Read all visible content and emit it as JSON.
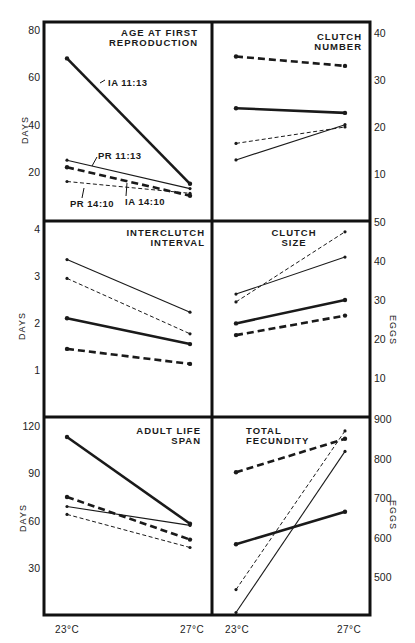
{
  "chart_data": [
    {
      "id": "age_first_reproduction",
      "type": "line",
      "title": "AGE AT FIRST REPRODUCTION",
      "title_lines": [
        "AGE AT FIRST",
        "REPRODUCTION"
      ],
      "ylabel": "DAYS",
      "yaxis_side": "left",
      "ylim": [
        0,
        80
      ],
      "yticks": [
        20,
        40,
        60,
        80
      ],
      "categories": [
        "23°C",
        "27°C"
      ],
      "grid": false,
      "series": [
        {
          "name": "IA 11:13",
          "style": "thick-solid",
          "values": [
            68,
            15
          ]
        },
        {
          "name": "IA 14:10",
          "style": "thick-dashed",
          "values": [
            22,
            10
          ]
        },
        {
          "name": "PR 11:13",
          "style": "thin-solid",
          "values": [
            25,
            13
          ]
        },
        {
          "name": "PR 14:10",
          "style": "thin-dashed",
          "values": [
            16,
            11
          ]
        }
      ],
      "annotations": [
        "IA 11:13",
        "PR 11:13",
        "PR 14:10",
        "IA 14:10"
      ]
    },
    {
      "id": "clutch_number",
      "type": "line",
      "title": "CLUTCH NUMBER",
      "title_lines": [
        "CLUTCH",
        "NUMBER"
      ],
      "ylabel": "",
      "yaxis_side": "right",
      "ylim": [
        0,
        42
      ],
      "yticks": [
        10,
        20,
        30,
        40
      ],
      "categories": [
        "23°C",
        "27°C"
      ],
      "grid": false,
      "series": [
        {
          "name": "IA 11:13",
          "style": "thick-solid",
          "values": [
            24,
            23
          ]
        },
        {
          "name": "IA 14:10",
          "style": "thick-dashed",
          "values": [
            35,
            33
          ]
        },
        {
          "name": "PR 11:13",
          "style": "thin-solid",
          "values": [
            13,
            20.5
          ]
        },
        {
          "name": "PR 14:10",
          "style": "thin-dashed",
          "values": [
            16.5,
            20
          ]
        }
      ]
    },
    {
      "id": "interclutch_interval",
      "type": "line",
      "title": "INTERCLUTCH INTERVAL",
      "title_lines": [
        "INTERCLUTCH",
        "INTERVAL"
      ],
      "ylabel": "DAYS",
      "yaxis_side": "left",
      "ylim": [
        0,
        4
      ],
      "yticks": [
        1,
        2,
        3,
        4
      ],
      "categories": [
        "23°C",
        "27°C"
      ],
      "grid": false,
      "series": [
        {
          "name": "IA 11:13",
          "style": "thick-solid",
          "values": [
            2.1,
            1.55
          ]
        },
        {
          "name": "IA 14:10",
          "style": "thick-dashed",
          "values": [
            1.45,
            1.13
          ]
        },
        {
          "name": "PR 11:13",
          "style": "thin-solid",
          "values": [
            3.35,
            2.23
          ]
        },
        {
          "name": "PR 14:10",
          "style": "thin-dashed",
          "values": [
            2.95,
            1.77
          ]
        }
      ]
    },
    {
      "id": "clutch_size",
      "type": "line",
      "title": "CLUTCH SIZE",
      "title_lines": [
        "CLUTCH",
        "SIZE"
      ],
      "ylabel": "EGGS",
      "yaxis_side": "right",
      "ylim": [
        0,
        50
      ],
      "yticks": [
        10,
        20,
        30,
        40,
        50
      ],
      "categories": [
        "23°C",
        "27°C"
      ],
      "grid": false,
      "series": [
        {
          "name": "IA 11:13",
          "style": "thick-solid",
          "values": [
            24,
            30
          ]
        },
        {
          "name": "IA 14:10",
          "style": "thick-dashed",
          "values": [
            21,
            26
          ]
        },
        {
          "name": "PR 11:13",
          "style": "thin-solid",
          "values": [
            31.5,
            41
          ]
        },
        {
          "name": "PR 14:10",
          "style": "thin-dashed",
          "values": [
            29.5,
            47.5
          ]
        }
      ]
    },
    {
      "id": "adult_life_span",
      "type": "line",
      "title": "ADULT LIFE SPAN",
      "title_lines": [
        "ADULT LIFE",
        "SPAN"
      ],
      "ylabel": "DAYS",
      "yaxis_side": "left",
      "ylim": [
        0,
        123
      ],
      "yticks": [
        30,
        60,
        90,
        120
      ],
      "categories": [
        "23°C",
        "27°C"
      ],
      "grid": false,
      "series": [
        {
          "name": "IA 11:13",
          "style": "thick-solid",
          "values": [
            113,
            58
          ]
        },
        {
          "name": "IA 14:10",
          "style": "thick-dashed",
          "values": [
            75,
            48
          ]
        },
        {
          "name": "PR 11:13",
          "style": "thin-solid",
          "values": [
            69,
            57
          ]
        },
        {
          "name": "PR 14:10",
          "style": "thin-dashed",
          "values": [
            64,
            43
          ]
        }
      ]
    },
    {
      "id": "total_fecundity",
      "type": "line",
      "title": "TOTAL FECUNDITY",
      "title_lines": [
        "TOTAL",
        "FECUNDITY"
      ],
      "ylabel": "EGGS",
      "yaxis_side": "right",
      "ylim": [
        410,
        900
      ],
      "yticks": [
        500,
        600,
        700,
        800,
        900
      ],
      "categories": [
        "23°C",
        "27°C"
      ],
      "grid": false,
      "series": [
        {
          "name": "IA 11:13",
          "style": "thick-solid",
          "values": [
            583,
            665
          ]
        },
        {
          "name": "IA 14:10",
          "style": "thick-dashed",
          "values": [
            765,
            850
          ]
        },
        {
          "name": "PR 11:13",
          "style": "thin-solid",
          "values": [
            410,
            818
          ]
        },
        {
          "name": "PR 14:10",
          "style": "thin-dashed",
          "values": [
            468,
            870
          ]
        }
      ]
    }
  ],
  "figure": {
    "x_categories": [
      "23°C",
      "27°C"
    ],
    "left_axis_titles": [
      "DAYS",
      "DAYS",
      "DAYS"
    ],
    "right_axis_titles": [
      "EGGS",
      "EGGS"
    ],
    "series_labels": {
      "ia_11_13": "IA 11:13",
      "pr_11_13": "PR 11:13",
      "pr_14_10": "PR 14:10",
      "ia_14_10": "IA 14:10"
    },
    "line_color": "#1a1a1a",
    "background": "#ffffff"
  }
}
